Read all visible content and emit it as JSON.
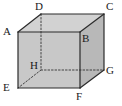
{
  "figure": {
    "name": "cuboid-diagram",
    "type": "geometric-solid",
    "solid": "rectangular prism (cuboid)",
    "width_px": 122,
    "height_px": 106,
    "background_color": "#ffffff"
  },
  "style": {
    "edge_color": "#2b2b2b",
    "hidden_edge_color": "#333333",
    "front_face_color": "#c8c8c8",
    "top_face_color": "#d2d2d2",
    "right_face_color": "#b8b8b8",
    "label_color": "#1a1a1a"
  },
  "vertices": [
    {
      "id": "A",
      "label": "A",
      "x": 18,
      "y": 32,
      "hidden": false,
      "label_x": 3,
      "label_y": 26
    },
    {
      "id": "B",
      "label": "B",
      "x": 80,
      "y": 32,
      "hidden": false,
      "label_x": 82,
      "label_y": 33
    },
    {
      "id": "C",
      "label": "C",
      "x": 104,
      "y": 14,
      "hidden": false,
      "label_x": 106,
      "label_y": 1
    },
    {
      "id": "D",
      "label": "D",
      "x": 41,
      "y": 14,
      "hidden": false,
      "label_x": 35,
      "label_y": 1
    },
    {
      "id": "E",
      "label": "E",
      "x": 18,
      "y": 88,
      "hidden": false,
      "label_x": 3,
      "label_y": 82
    },
    {
      "id": "F",
      "label": "F",
      "x": 80,
      "y": 88,
      "hidden": false,
      "label_x": 76,
      "label_y": 91
    },
    {
      "id": "G",
      "label": "G",
      "x": 104,
      "y": 70,
      "hidden": false,
      "label_x": 106,
      "label_y": 65
    },
    {
      "id": "H",
      "label": "H",
      "x": 41,
      "y": 70,
      "hidden": true,
      "label_x": 30,
      "label_y": 60
    }
  ],
  "faces": [
    {
      "id": "top",
      "name": "face-ADCB",
      "points": "18,32 41,14 104,14 80,32",
      "fill": "#d2d2d2"
    },
    {
      "id": "front",
      "name": "face-ABFE",
      "points": "18,32 80,32 80,88 18,88",
      "fill": "#c8c8c8"
    },
    {
      "id": "right",
      "name": "face-BCGF",
      "points": "80,32 104,14 104,70 80,88",
      "fill": "#b8b8b8"
    }
  ],
  "edges": [
    {
      "id": "AB",
      "name": "edge-AB",
      "from": "A",
      "to": "B",
      "hidden": false,
      "x1": 18,
      "y1": 32,
      "x2": 80,
      "y2": 32
    },
    {
      "id": "BF",
      "name": "edge-BF",
      "from": "B",
      "to": "F",
      "hidden": false,
      "x1": 80,
      "y1": 32,
      "x2": 80,
      "y2": 88
    },
    {
      "id": "FE",
      "name": "edge-FE",
      "from": "F",
      "to": "E",
      "hidden": false,
      "x1": 80,
      "y1": 88,
      "x2": 18,
      "y2": 88
    },
    {
      "id": "EA",
      "name": "edge-EA",
      "from": "E",
      "to": "A",
      "hidden": false,
      "x1": 18,
      "y1": 88,
      "x2": 18,
      "y2": 32
    },
    {
      "id": "AD",
      "name": "edge-AD",
      "from": "A",
      "to": "D",
      "hidden": false,
      "x1": 18,
      "y1": 32,
      "x2": 41,
      "y2": 14
    },
    {
      "id": "DC",
      "name": "edge-DC",
      "from": "D",
      "to": "C",
      "hidden": false,
      "x1": 41,
      "y1": 14,
      "x2": 104,
      "y2": 14
    },
    {
      "id": "CB",
      "name": "edge-CB",
      "from": "C",
      "to": "B",
      "hidden": false,
      "x1": 104,
      "y1": 14,
      "x2": 80,
      "y2": 32
    },
    {
      "id": "CG",
      "name": "edge-CG",
      "from": "C",
      "to": "G",
      "hidden": false,
      "x1": 104,
      "y1": 14,
      "x2": 104,
      "y2": 70
    },
    {
      "id": "GF",
      "name": "edge-GF",
      "from": "G",
      "to": "F",
      "hidden": false,
      "x1": 104,
      "y1": 70,
      "x2": 80,
      "y2": 88
    },
    {
      "id": "DH",
      "name": "edge-DH",
      "from": "D",
      "to": "H",
      "hidden": true,
      "x1": 41,
      "y1": 14,
      "x2": 41,
      "y2": 70
    },
    {
      "id": "HE",
      "name": "edge-HE",
      "from": "H",
      "to": "E",
      "hidden": true,
      "x1": 41,
      "y1": 70,
      "x2": 18,
      "y2": 88
    },
    {
      "id": "HG",
      "name": "edge-HG",
      "from": "H",
      "to": "G",
      "hidden": true,
      "x1": 41,
      "y1": 70,
      "x2": 104,
      "y2": 70
    }
  ]
}
